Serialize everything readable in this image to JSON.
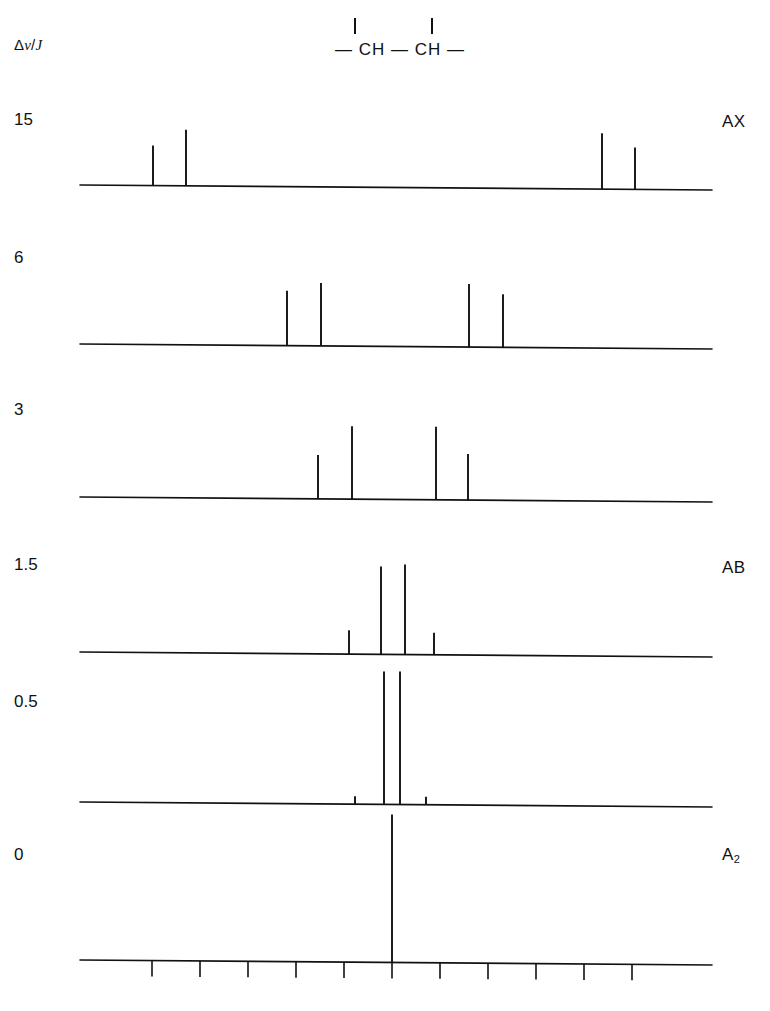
{
  "figure": {
    "y_axis_label": "Δν/J",
    "y_axis_label_parts": {
      "delta": "Δ",
      "nu": "ν",
      "slash": "/",
      "j": "J"
    },
    "molecule": {
      "formula_text": "— CH — CH —",
      "atoms": [
        "CH",
        "CH"
      ],
      "description": "two CH groups joined by a bond, each bearing a vertical bond"
    },
    "row_labels": [
      "15",
      "6",
      "3",
      "1.5",
      "0.5",
      "0"
    ],
    "type_labels": [
      "AX",
      "",
      "",
      "AB",
      "",
      "A2"
    ],
    "type_labels_display": {
      "ax": "AX",
      "ab": "AB",
      "a2_base": "A",
      "a2_sub": "2"
    },
    "colors": {
      "ink": "#111111",
      "background": "#ffffff"
    }
  },
  "chart_data": {
    "type": "line",
    "xlabel": "",
    "ylabel": "Δν/J",
    "grid": false,
    "legend": "none",
    "xlim": [
      -6,
      6
    ],
    "axis": {
      "baseline_x_start": 80,
      "baseline_x_end": 712,
      "tick_positions": [
        152,
        200,
        248,
        296,
        344,
        392,
        440,
        488,
        536,
        584,
        632
      ],
      "tick_count": 11,
      "ticks_only_on_bottom_trace": true
    },
    "series": [
      {
        "name": "15",
        "label": "AX",
        "baseline_y": 188,
        "peaks": [
          {
            "x": 153,
            "height": 40
          },
          {
            "x": 186,
            "height": 56
          },
          {
            "x": 602,
            "height": 56
          },
          {
            "x": 635,
            "height": 42
          }
        ]
      },
      {
        "name": "6",
        "label": "",
        "baseline_y": 347,
        "peaks": [
          {
            "x": 287,
            "height": 55
          },
          {
            "x": 321,
            "height": 63
          },
          {
            "x": 469,
            "height": 63
          },
          {
            "x": 503,
            "height": 53
          }
        ]
      },
      {
        "name": "3",
        "label": "",
        "baseline_y": 500,
        "peaks": [
          {
            "x": 318,
            "height": 44
          },
          {
            "x": 352,
            "height": 73
          },
          {
            "x": 436,
            "height": 73
          },
          {
            "x": 468,
            "height": 46
          }
        ]
      },
      {
        "name": "1.5",
        "label": "AB",
        "baseline_y": 655,
        "peaks": [
          {
            "x": 349,
            "height": 24
          },
          {
            "x": 381,
            "height": 88
          },
          {
            "x": 405,
            "height": 90
          },
          {
            "x": 434,
            "height": 22
          }
        ]
      },
      {
        "name": "0.5",
        "label": "",
        "baseline_y": 805,
        "peaks": [
          {
            "x": 355,
            "height": 8
          },
          {
            "x": 384,
            "height": 133
          },
          {
            "x": 400,
            "height": 133
          },
          {
            "x": 426,
            "height": 8
          }
        ]
      },
      {
        "name": "0",
        "label": "A2",
        "baseline_y": 963,
        "peaks": [
          {
            "x": 392,
            "height": 148
          }
        ]
      }
    ]
  }
}
